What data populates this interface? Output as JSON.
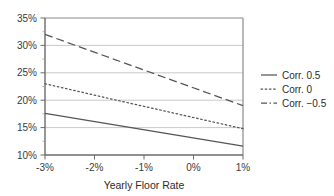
{
  "chart_data": {
    "type": "line",
    "title": "",
    "xlabel": "Yearly Floor Rate",
    "ylabel": "",
    "xlim": [
      -3,
      1
    ],
    "ylim": [
      10,
      35
    ],
    "grid": true,
    "grid_axis": "y",
    "legend_position": "right",
    "x_ticks": [
      -3,
      -2,
      -1,
      0,
      1
    ],
    "x_tick_labels": [
      "-3%",
      "-2%",
      "-1%",
      "0%",
      "1%"
    ],
    "y_ticks": [
      10,
      15,
      20,
      25,
      30,
      35
    ],
    "y_tick_labels": [
      "10%",
      "15%",
      "20%",
      "25%",
      "30%",
      "35%"
    ],
    "x": [
      -3,
      -2,
      -1.7,
      -1,
      0,
      1
    ],
    "series": [
      {
        "name": "Corr. 0.5",
        "style": "solid",
        "color": "#555555",
        "x": [
          -3,
          1
        ],
        "values": [
          17.6,
          11.6
        ]
      },
      {
        "name": "Corr. 0",
        "style": "dotted",
        "color": "#555555",
        "x": [
          -3,
          -1.7,
          1
        ],
        "values": [
          23.0,
          20.3,
          14.8
        ]
      },
      {
        "name": "Corr. -0.5",
        "style": "dashed",
        "color": "#555555",
        "x": [
          -3,
          1
        ],
        "values": [
          32.0,
          19.0
        ]
      }
    ]
  },
  "legend": {
    "items": [
      {
        "label": "Corr. 0.5"
      },
      {
        "label": "Corr. 0"
      },
      {
        "label": "Corr. −0.5"
      }
    ]
  },
  "axis": {
    "x_title": "Yearly Floor Rate",
    "y_tick_0": "10%",
    "y_tick_1": "15%",
    "y_tick_2": "20%",
    "y_tick_3": "25%",
    "y_tick_4": "30%",
    "y_tick_5": "35%",
    "x_tick_0": "-3%",
    "x_tick_1": "-2%",
    "x_tick_2": "-1%",
    "x_tick_3": "0%",
    "x_tick_4": "1%"
  },
  "colors": {
    "line": "#555555",
    "grid": "#c9c9c9",
    "axis": "#6b6b6b",
    "text": "#2b2b2b"
  }
}
